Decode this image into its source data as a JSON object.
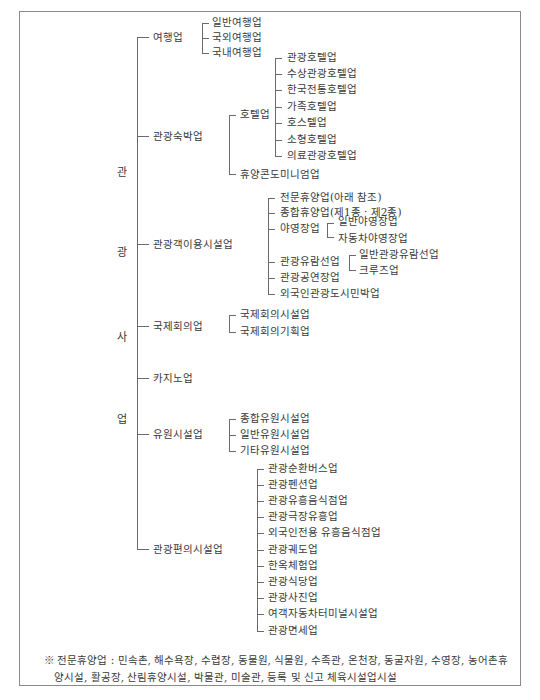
{
  "root": {
    "chars": [
      "관",
      "광",
      "사",
      "업"
    ],
    "label": "관광사업"
  },
  "categories": [
    {
      "label": "여행업",
      "children": [
        "일반여행업",
        "국외여행업",
        "국내여행업"
      ]
    },
    {
      "label": "관광숙박업",
      "children": [
        {
          "label": "호텔업",
          "children": [
            "관광호텔업",
            "수상관광호텔업",
            "한국전통호텔업",
            "가족호텔업",
            "호스텔업",
            "소형호텔업",
            "의료관광호텔업"
          ]
        },
        {
          "label": "휴양콘도미니엄업"
        }
      ]
    },
    {
      "label": "관광객이용시설업",
      "children": [
        {
          "label": "전문휴양업(아래 참조)"
        },
        {
          "label": "종합휴양업(제1종 · 제2종)"
        },
        {
          "label": "야영장업",
          "children": [
            "일반야영장업",
            "자동차야영장업"
          ]
        },
        {
          "label": "관광유람선업",
          "children": [
            "일반관광유람선업",
            "크루즈업"
          ]
        },
        {
          "label": "관광공연장업"
        },
        {
          "label": "외국인관광도시민박업"
        }
      ]
    },
    {
      "label": "국제회의업",
      "children": [
        "국제회의시설업",
        "국제회의기획업"
      ]
    },
    {
      "label": "카지노업"
    },
    {
      "label": "유원시설업",
      "children": [
        "종합유원시설업",
        "일반유원시설업",
        "기타유원시설업"
      ]
    },
    {
      "label": "관광편의시설업",
      "children": [
        "관광순환버스업",
        "관광펜션업",
        "관광유흥음식점업",
        "관광극장유흥업",
        "외국인전용 유흥음식점업",
        "관광궤도업",
        "한옥체험업",
        "관광식당업",
        "관광사진업",
        "여객자동차터미널시설업",
        "관광면세업"
      ]
    }
  ],
  "note": {
    "line1": "※ 전문휴양업 : 민속촌, 해수욕장, 수렵장, 동물원, 식물원, 수족관, 온천장, 동굴자원, 수영장, 농어촌휴",
    "line2": "양시설, 활공장, 산림휴양시설, 박물관, 미술관, 등록 및 신고 체육시설업시설"
  }
}
